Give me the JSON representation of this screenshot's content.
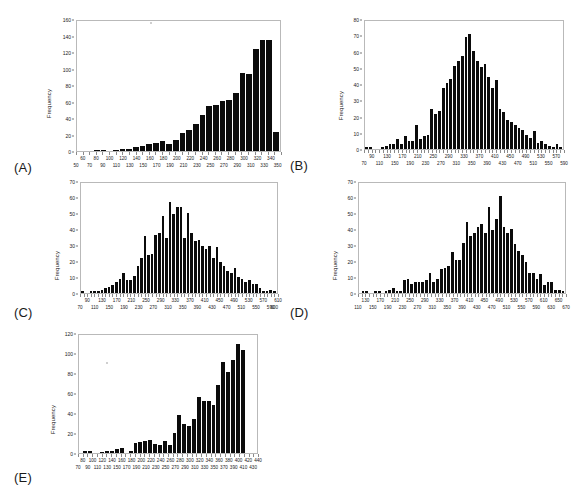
{
  "figure": {
    "title": "",
    "background": "#ffffff",
    "bar_color": "#0b0b0b",
    "axis_color": "#b9b9b9"
  },
  "panels": [
    {
      "tag": "(A)",
      "ylabel": "Frequency",
      "yticks": [
        "0",
        "20",
        "40",
        "60",
        "80",
        "100",
        "120",
        "140",
        "160"
      ],
      "xticks_row1": [
        "60",
        "80",
        "100",
        "120",
        "140",
        "160",
        "180",
        "200",
        "220",
        "240",
        "260",
        "280",
        "300",
        "320",
        "340"
      ],
      "xticks_row2": [
        "50",
        "70",
        "90",
        "110",
        "130",
        "150",
        "170",
        "190",
        "210",
        "230",
        "250",
        "270",
        "290",
        "310",
        "330",
        "350"
      ]
    },
    {
      "tag": "(B)",
      "ylabel": "Frequency",
      "yticks": [
        "0",
        "10",
        "20",
        "30",
        "40",
        "50",
        "60",
        "70",
        "80"
      ],
      "xticks_row1": [
        "90",
        "130",
        "170",
        "210",
        "250",
        "290",
        "330",
        "370",
        "410",
        "450",
        "490",
        "530",
        "570"
      ],
      "xticks_row2": [
        "70",
        "110",
        "150",
        "190",
        "230",
        "270",
        "310",
        "350",
        "390",
        "430",
        "470",
        "510",
        "550",
        "590"
      ]
    },
    {
      "tag": "(C)",
      "ylabel": "Frequency",
      "yticks": [
        "0",
        "10",
        "20",
        "30",
        "40",
        "50",
        "60",
        "70"
      ],
      "xticks_row1": [
        "90",
        "130",
        "170",
        "210",
        "250",
        "290",
        "330",
        "370",
        "410",
        "450",
        "490",
        "530",
        "570",
        "610"
      ],
      "xticks_row2": [
        "70",
        "110",
        "150",
        "190",
        "230",
        "270",
        "310",
        "350",
        "390",
        "430",
        "470",
        "510",
        "550",
        "590",
        "600"
      ]
    },
    {
      "tag": "(D)",
      "ylabel": "Frequency",
      "yticks": [
        "0",
        "10",
        "20",
        "30",
        "40",
        "50",
        "60",
        "70"
      ],
      "xticks_row1": [
        "130",
        "170",
        "210",
        "250",
        "290",
        "330",
        "370",
        "410",
        "450",
        "490",
        "530",
        "570",
        "610",
        "650"
      ],
      "xticks_row2": [
        "110",
        "150",
        "190",
        "230",
        "270",
        "310",
        "350",
        "390",
        "430",
        "470",
        "510",
        "550",
        "590",
        "630",
        "670"
      ]
    },
    {
      "tag": "(E)",
      "ylabel": "Frequency",
      "yticks": [
        "0",
        "20",
        "40",
        "60",
        "80",
        "100",
        "120"
      ],
      "xticks_row1": [
        "80",
        "100",
        "120",
        "140",
        "160",
        "180",
        "200",
        "220",
        "240",
        "260",
        "280",
        "300",
        "320",
        "340",
        "360",
        "380",
        "400",
        "420",
        "440"
      ],
      "xticks_row2": [
        "70",
        "90",
        "110",
        "130",
        "150",
        "170",
        "190",
        "210",
        "230",
        "250",
        "270",
        "290",
        "310",
        "330",
        "350",
        "370",
        "390",
        "410",
        "430"
      ]
    }
  ],
  "chart_data": [
    {
      "type": "bar",
      "panel": "A",
      "title": "",
      "xlabel": "",
      "ylabel": "Frequency",
      "ylim": [
        0,
        160
      ],
      "xlim": [
        50,
        355
      ],
      "grid": false,
      "legend": "none",
      "bin_width": 10,
      "bin_starts": [
        50,
        60,
        70,
        80,
        90,
        100,
        110,
        120,
        130,
        140,
        150,
        160,
        170,
        180,
        190,
        200,
        210,
        220,
        230,
        240,
        250,
        260,
        270,
        280,
        290,
        300,
        310,
        320,
        330,
        340,
        350
      ],
      "values": [
        0,
        0,
        0,
        1,
        1,
        0,
        1,
        2,
        2,
        5,
        6,
        9,
        10,
        12,
        9,
        13,
        22,
        26,
        33,
        44,
        55,
        57,
        62,
        63,
        72,
        96,
        95,
        125,
        137,
        137,
        23
      ]
    },
    {
      "type": "bar",
      "panel": "B",
      "title": "",
      "xlabel": "",
      "ylabel": "Frequency",
      "ylim": [
        0,
        80
      ],
      "xlim": [
        70,
        590
      ],
      "grid": false,
      "legend": "none",
      "bin_width": 10,
      "bin_starts": [
        70,
        80,
        90,
        100,
        110,
        120,
        130,
        140,
        150,
        160,
        170,
        180,
        190,
        200,
        210,
        220,
        230,
        240,
        250,
        260,
        270,
        280,
        290,
        300,
        310,
        320,
        330,
        340,
        350,
        360,
        370,
        380,
        390,
        400,
        410,
        420,
        430,
        440,
        450,
        460,
        470,
        480,
        490,
        500,
        510,
        520,
        530,
        540,
        550,
        560,
        570,
        580,
        590
      ],
      "values": [
        1,
        1,
        0,
        0,
        0,
        1,
        2,
        3,
        3,
        6,
        3,
        8,
        5,
        5,
        15,
        6,
        8,
        9,
        25,
        22,
        24,
        38,
        41,
        44,
        52,
        55,
        58,
        70,
        72,
        61,
        55,
        51,
        53,
        45,
        38,
        43,
        25,
        23,
        18,
        17,
        15,
        13,
        12,
        9,
        7,
        11,
        4,
        5,
        3,
        2,
        1,
        3,
        1
      ]
    },
    {
      "type": "bar",
      "panel": "C",
      "title": "",
      "xlabel": "",
      "ylabel": "Frequency",
      "ylim": [
        0,
        70
      ],
      "xlim": [
        70,
        610
      ],
      "grid": false,
      "legend": "none",
      "bin_width": 10,
      "bin_starts": [
        70,
        80,
        90,
        100,
        110,
        120,
        130,
        140,
        150,
        160,
        170,
        180,
        190,
        200,
        210,
        220,
        230,
        240,
        250,
        260,
        270,
        280,
        290,
        300,
        310,
        320,
        330,
        340,
        350,
        360,
        370,
        380,
        390,
        400,
        410,
        420,
        430,
        440,
        450,
        460,
        470,
        480,
        490,
        500,
        510,
        520,
        530,
        540,
        550,
        560,
        570,
        580,
        590,
        600,
        610
      ],
      "values": [
        1,
        0,
        0,
        1,
        1,
        1,
        2,
        3,
        4,
        5,
        7,
        9,
        13,
        8,
        8,
        11,
        17,
        22,
        36,
        24,
        25,
        37,
        38,
        49,
        35,
        58,
        50,
        55,
        55,
        35,
        51,
        38,
        33,
        34,
        30,
        28,
        30,
        22,
        29,
        20,
        17,
        14,
        13,
        16,
        10,
        9,
        7,
        8,
        6,
        6,
        3,
        1,
        1,
        2,
        1
      ]
    },
    {
      "type": "bar",
      "panel": "D",
      "title": "",
      "xlabel": "",
      "ylabel": "Frequency",
      "ylim": [
        0,
        70
      ],
      "xlim": [
        110,
        670
      ],
      "grid": false,
      "legend": "none",
      "bin_width": 10,
      "bin_starts": [
        110,
        120,
        130,
        140,
        150,
        160,
        170,
        180,
        190,
        200,
        210,
        220,
        230,
        240,
        250,
        260,
        270,
        280,
        290,
        300,
        310,
        320,
        330,
        340,
        350,
        360,
        370,
        380,
        390,
        400,
        410,
        420,
        430,
        440,
        450,
        460,
        470,
        480,
        490,
        500,
        510,
        520,
        530,
        540,
        550,
        560,
        570,
        580,
        590,
        600,
        610,
        620,
        630,
        640,
        650,
        660,
        670
      ],
      "values": [
        0,
        1,
        1,
        0,
        0,
        1,
        1,
        0,
        1,
        2,
        3,
        1,
        1,
        8,
        9,
        6,
        7,
        7,
        7,
        8,
        13,
        7,
        9,
        15,
        16,
        17,
        26,
        21,
        21,
        32,
        45,
        36,
        38,
        42,
        44,
        38,
        55,
        40,
        47,
        62,
        42,
        38,
        41,
        31,
        27,
        24,
        20,
        13,
        13,
        9,
        12,
        5,
        7,
        7,
        2,
        2,
        1
      ]
    },
    {
      "type": "bar",
      "panel": "E",
      "title": "",
      "xlabel": "",
      "ylabel": "Frequency",
      "ylim": [
        0,
        120
      ],
      "xlim": [
        70,
        440
      ],
      "grid": false,
      "legend": "none",
      "bin_width": 10,
      "bin_starts": [
        70,
        80,
        90,
        100,
        110,
        120,
        130,
        140,
        150,
        160,
        170,
        180,
        190,
        200,
        210,
        220,
        230,
        240,
        250,
        260,
        270,
        280,
        290,
        300,
        310,
        320,
        330,
        340,
        350,
        360,
        370,
        380,
        390,
        400,
        410,
        420,
        430,
        440
      ],
      "values": [
        0,
        2,
        2,
        0,
        0,
        1,
        2,
        2,
        4,
        5,
        0,
        2,
        10,
        11,
        12,
        13,
        9,
        8,
        12,
        8,
        20,
        39,
        30,
        27,
        35,
        57,
        53,
        53,
        49,
        69,
        93,
        82,
        95,
        111,
        105,
        0,
        0,
        0
      ]
    }
  ]
}
